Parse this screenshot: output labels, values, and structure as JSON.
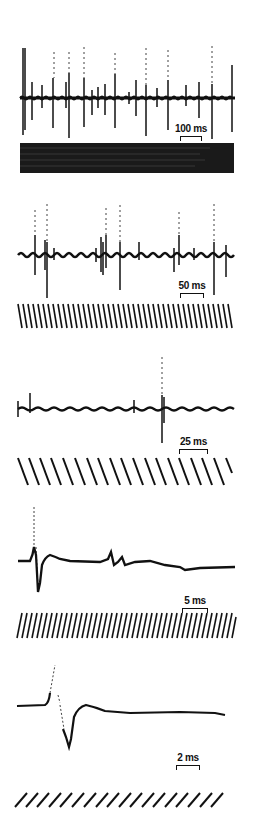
{
  "figure": {
    "panels": [
      {
        "id": "A",
        "scale_label": "100 ms",
        "top": 40
      },
      {
        "id": "B",
        "scale_label": "50 ms",
        "top": 200
      },
      {
        "id": "C",
        "scale_label": "25 ms",
        "top": 345
      },
      {
        "id": "D",
        "scale_label": "5 ms",
        "top": 495
      },
      {
        "id": "E",
        "scale_label": "2 ms",
        "top": 655
      }
    ]
  },
  "colors": {
    "trace": "#111111",
    "background": "#ffffff"
  }
}
